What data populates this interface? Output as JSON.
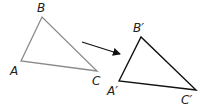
{
  "diagram": {
    "original": {
      "color": "#8a8a8a",
      "vertices": {
        "A": {
          "label": "A",
          "x": 21,
          "y": 61
        },
        "B": {
          "label": "B",
          "x": 42,
          "y": 17
        },
        "C": {
          "label": "C",
          "x": 97,
          "y": 71
        }
      }
    },
    "image": {
      "color": "#111111",
      "vertices": {
        "A": {
          "label": "A′",
          "x": 119,
          "y": 81
        },
        "B": {
          "label": "B′",
          "x": 141,
          "y": 37
        },
        "C": {
          "label": "C′",
          "x": 196,
          "y": 90
        }
      }
    },
    "arrow": {
      "color": "#111111",
      "x1": 82,
      "y1": 42,
      "x2": 120,
      "y2": 54
    }
  }
}
